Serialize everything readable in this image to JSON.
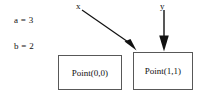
{
  "diagram": {
    "background_color": "#ffffff",
    "stroke_color": "#111111",
    "box_border_color": "#585858",
    "variables": [
      {
        "name": "a",
        "text": "a = 3"
      },
      {
        "name": "b",
        "text": "b = 2"
      }
    ],
    "references": [
      {
        "name": "x",
        "label": "x",
        "target": "Point(1,1)"
      },
      {
        "name": "y",
        "label": "y",
        "target": "Point(1,1)"
      }
    ],
    "objects": [
      {
        "name": "point-0-0",
        "label": "Point(0,0)"
      },
      {
        "name": "point-1-1",
        "label": "Point(1,1)"
      }
    ],
    "arrows": [
      {
        "name": "x-arrow",
        "from": "x",
        "to": "point-1-1",
        "style": "diagonal"
      },
      {
        "name": "y-arrow",
        "from": "y",
        "to": "point-1-1",
        "style": "vertical"
      }
    ]
  }
}
